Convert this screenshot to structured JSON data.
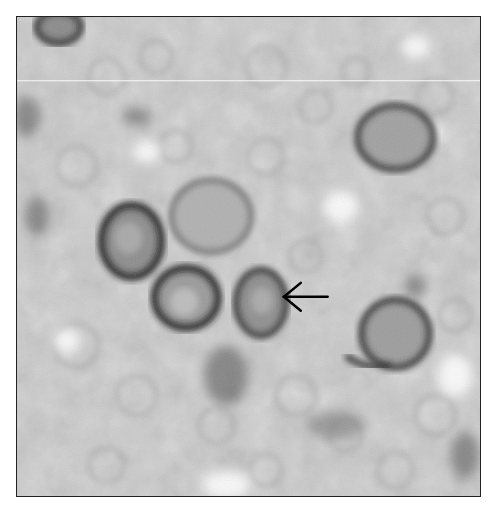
{
  "figure": {
    "description": "Grayscale immunohistochemistry micrograph showing several large cells with dark membrane staining among a background of smaller pale cells",
    "background_gray": "#c9c9c9",
    "border_color": "#222222",
    "scan_line": {
      "y": 64,
      "color": "#ffffff"
    },
    "annotation": {
      "type": "arrow",
      "direction": "left",
      "target": "stained-cell-center",
      "color": "#000000",
      "tip": [
        268,
        281
      ],
      "tail": [
        312,
        281
      ]
    },
    "stained_cells": [
      {
        "name": "cell-upper-left-corner",
        "cx": 40,
        "cy": 10,
        "rx": 26,
        "ry": 18,
        "intensity": 0.75
      },
      {
        "name": "cell-left-dark",
        "cx": 115,
        "cy": 225,
        "rx": 32,
        "ry": 38,
        "intensity": 0.85
      },
      {
        "name": "cell-center-lower",
        "cx": 170,
        "cy": 282,
        "rx": 34,
        "ry": 32,
        "intensity": 0.85
      },
      {
        "name": "cell-arrow-target",
        "cx": 245,
        "cy": 287,
        "rx": 27,
        "ry": 35,
        "intensity": 0.7
      },
      {
        "name": "cell-upper-right",
        "cx": 380,
        "cy": 121,
        "rx": 40,
        "ry": 34,
        "intensity": 0.65
      },
      {
        "name": "cell-right-lower",
        "cx": 378,
        "cy": 320,
        "rx": 38,
        "ry": 36,
        "intensity": 0.7
      },
      {
        "name": "cell-center-pale",
        "cx": 195,
        "cy": 200,
        "rx": 42,
        "ry": 38,
        "intensity": 0.3
      }
    ]
  }
}
